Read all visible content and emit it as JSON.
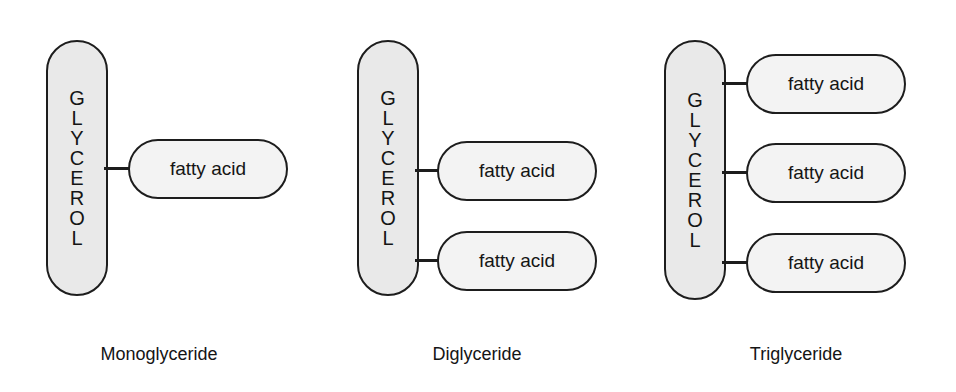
{
  "figure": {
    "background_color": "#ffffff",
    "glycerol_fill": "#e9e9e9",
    "fatty_fill": "#f3f3f3",
    "stroke_color": "#1d1d1d",
    "glycerol_label": "GLYCEROL",
    "glycerol_letters": [
      "G",
      "L",
      "Y",
      "C",
      "E",
      "R",
      "O",
      "L"
    ]
  },
  "panels": [
    {
      "id": "monoglyceride",
      "caption": "Monoglyceride",
      "glycerol_letters": [
        "G",
        "L",
        "Y",
        "C",
        "E",
        "R",
        "O",
        "L"
      ],
      "fatty_acids": [
        {
          "label": "fatty acid"
        }
      ]
    },
    {
      "id": "diglyceride",
      "caption": "Diglyceride",
      "glycerol_letters": [
        "G",
        "L",
        "Y",
        "C",
        "E",
        "R",
        "O",
        "L"
      ],
      "fatty_acids": [
        {
          "label": "fatty acid"
        },
        {
          "label": "fatty acid"
        }
      ]
    },
    {
      "id": "triglyceride",
      "caption": "Triglyceride",
      "glycerol_letters": [
        "G",
        "L",
        "Y",
        "C",
        "E",
        "R",
        "O",
        "L"
      ],
      "fatty_acids": [
        {
          "label": "fatty acid"
        },
        {
          "label": "fatty acid"
        },
        {
          "label": "fatty acid"
        }
      ]
    }
  ]
}
